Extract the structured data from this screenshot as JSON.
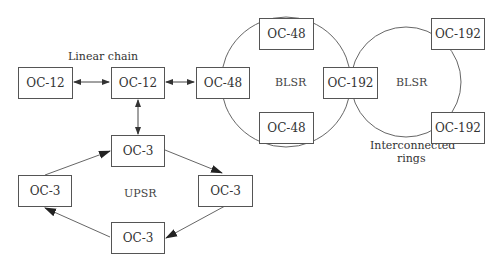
{
  "diagram": {
    "labels": {
      "linear_chain": "Linear chain",
      "interconnected": "Interconnected",
      "rings": "rings",
      "upsr": "UPSR",
      "blsr_left": "BLSR",
      "blsr_right": "BLSR"
    },
    "nodes": {
      "chain_left": "OC-12",
      "chain_mid": "OC-12",
      "blsr1_left": "OC-48",
      "blsr1_top": "OC-48",
      "blsr1_bottom": "OC-48",
      "blsr_shared": "OC-192",
      "blsr2_top": "OC-192",
      "blsr2_bottom": "OC-192",
      "upsr_top": "OC-3",
      "upsr_left": "OC-3",
      "upsr_right": "OC-3",
      "upsr_bottom": "OC-3"
    },
    "colors": {
      "line": "#555555",
      "text": "#333333"
    }
  }
}
